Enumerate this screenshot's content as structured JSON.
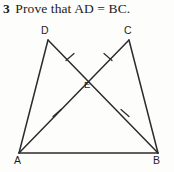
{
  "exercise": {
    "number": "3",
    "prompt": "Prove that AD = BC."
  },
  "figure": {
    "kind": "geometry-diagram",
    "stroke_color": "#2b2b2b",
    "background_color": "#fdfdfc",
    "vertices": [
      {
        "id": "D",
        "label": "D",
        "x": 48,
        "y": 40
      },
      {
        "id": "C",
        "label": "C",
        "x": 129,
        "y": 40
      },
      {
        "id": "E",
        "label": "E",
        "x": 88,
        "y": 77
      },
      {
        "id": "A",
        "label": "A",
        "x": 19,
        "y": 153
      },
      {
        "id": "B",
        "label": "B",
        "x": 158,
        "y": 153
      }
    ],
    "segments": [
      {
        "name": "AB",
        "from": "A",
        "to": "B"
      },
      {
        "name": "AD",
        "from": "A",
        "to": "D"
      },
      {
        "name": "BC",
        "from": "B",
        "to": "C"
      },
      {
        "name": "AC",
        "from": "A",
        "to": "C"
      },
      {
        "name": "BD",
        "from": "B",
        "to": "D"
      }
    ],
    "tick_marks": [
      {
        "on": "DE",
        "x": 70,
        "y": 57,
        "count": 1
      },
      {
        "on": "CE",
        "x": 108,
        "y": 57,
        "count": 1
      },
      {
        "on": "AE",
        "x": 57,
        "y": 113,
        "count": 1
      },
      {
        "on": "BE",
        "x": 125,
        "y": 113,
        "count": 1
      }
    ]
  }
}
